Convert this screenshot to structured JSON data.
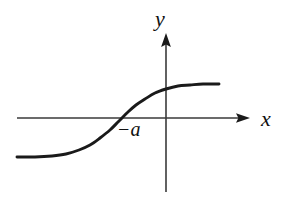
{
  "figure": {
    "background_color": "#ffffff",
    "stroke_color": "#1a1a1a",
    "axis_color": "#3a3a3a"
  },
  "labels": {
    "y_axis": "y",
    "x_axis": "x",
    "root_marker": "−a"
  },
  "chart_data": {
    "type": "line",
    "title": "",
    "xlabel": "x",
    "ylabel": "y",
    "grid": false,
    "legend": null,
    "axes": {
      "x_axis": {
        "label": "x",
        "arrow": true,
        "drawn_from_px": [
          17,
          118
        ],
        "drawn_to_px": [
          250,
          118
        ]
      },
      "y_axis": {
        "label": "y",
        "arrow": true,
        "drawn_from_px": [
          166,
          192
        ],
        "drawn_to_px": [
          166,
          33
        ]
      },
      "origin_px": [
        166,
        118
      ]
    },
    "annotations": [
      {
        "text": "−a",
        "meaning": "x-intercept of the curve",
        "position_px": [
          118,
          134
        ]
      }
    ],
    "asymptotes": {
      "lower_left_y_px": 157,
      "upper_right_y_px": 84
    },
    "x_intercept_px": 122,
    "y_intercept_px": 89,
    "points_px": [
      [
        17,
        157
      ],
      [
        35,
        157
      ],
      [
        52,
        156
      ],
      [
        66,
        154
      ],
      [
        79,
        150
      ],
      [
        90,
        145
      ],
      [
        100,
        138
      ],
      [
        110,
        130
      ],
      [
        118,
        122
      ],
      [
        122,
        118
      ],
      [
        128,
        112
      ],
      [
        136,
        105
      ],
      [
        145,
        99
      ],
      [
        155,
        93
      ],
      [
        166,
        89
      ],
      [
        178,
        86
      ],
      [
        190,
        85
      ],
      [
        203,
        84
      ],
      [
        219,
        84
      ]
    ]
  }
}
